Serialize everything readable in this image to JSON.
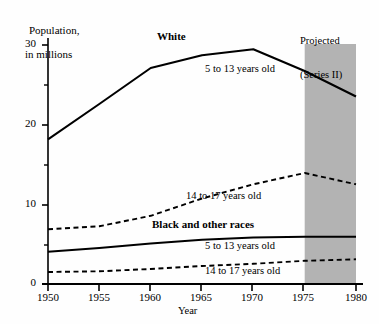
{
  "chart_data": {
    "type": "line",
    "title": "",
    "ylabel_line1": "Population,",
    "ylabel_line2": "in millions",
    "xlabel": "Year",
    "xlim": [
      1950,
      1980
    ],
    "ylim": [
      0,
      32
    ],
    "yticks": [
      0,
      10,
      20,
      30
    ],
    "yticks_minor": [
      5,
      15,
      25
    ],
    "ytick_labels": [
      "0",
      "10",
      "20",
      "30"
    ],
    "xticks": [
      1950,
      1955,
      1960,
      1965,
      1970,
      1975,
      1980
    ],
    "xtick_labels": [
      "1950",
      "1955",
      "1960",
      "1965",
      "1970",
      "1975",
      "1980"
    ],
    "grid": false,
    "legend_position": "inline-annotations",
    "group_labels": [
      {
        "text": "White",
        "x": 1962,
        "y": 31.5
      },
      {
        "text": "Black and other races",
        "x": 1961,
        "y": 7.8
      }
    ],
    "annotations": [
      {
        "text": "5 to 13 years old",
        "x": 1967,
        "y": 27.5,
        "series": "white_5_13"
      },
      {
        "text": "14 to 17 years old",
        "x": 1969,
        "y": 11.3,
        "series": "white_14_17"
      },
      {
        "text": "5 to 13 years old",
        "x": 1967,
        "y": 4.7,
        "series": "black_5_13"
      },
      {
        "text": "14 to 17 years old",
        "x": 1967,
        "y": 1.2,
        "series": "black_14_17"
      }
    ],
    "projection": {
      "label_line1": "Projected",
      "label_line2": "(Series II)",
      "x_start": 1975,
      "x_end": 1980,
      "shade_color": "#b3b3b3"
    },
    "x": [
      1950,
      1955,
      1960,
      1965,
      1970,
      1975,
      1980
    ],
    "series": [
      {
        "name": "White, 5 to 13 years old",
        "style": "solid",
        "color": "#000000",
        "values": [
          19.3,
          24.0,
          28.8,
          30.5,
          31.3,
          28.4,
          25.0
        ]
      },
      {
        "name": "White, 14 to 17 years old",
        "style": "dashed",
        "color": "#000000",
        "values": [
          7.3,
          7.7,
          9.1,
          11.4,
          13.3,
          14.8,
          13.3
        ]
      },
      {
        "name": "Black and other races, 5 to 13 years old",
        "style": "solid",
        "color": "#000000",
        "values": [
          4.3,
          4.8,
          5.4,
          5.9,
          6.2,
          6.3,
          6.3
        ]
      },
      {
        "name": "Black and other races, 14 to 17 years old",
        "style": "dashed",
        "color": "#000000",
        "values": [
          1.6,
          1.7,
          2.0,
          2.4,
          2.7,
          3.1,
          3.3
        ]
      }
    ]
  },
  "axis": {
    "y_title_line1": "Population,",
    "y_title_line2": "in millions",
    "x_title": "Year",
    "y_tick_30": "30",
    "y_tick_20": "20",
    "y_tick_10": "10",
    "y_tick_0": "0",
    "x_tick_1950": "1950",
    "x_tick_1955": "1955",
    "x_tick_1960": "1960",
    "x_tick_1965": "1965",
    "x_tick_1970": "1970",
    "x_tick_1975": "1975",
    "x_tick_1980": "1980"
  },
  "labels": {
    "white": "White",
    "black_other": "Black and other races",
    "white_5_13": "5 to 13 years old",
    "white_14_17": "14 to 17 years old",
    "black_5_13": "5 to 13 years old",
    "black_14_17": "14 to 17 years old",
    "projected_line1": "Projected",
    "projected_line2": "(Series II)"
  }
}
